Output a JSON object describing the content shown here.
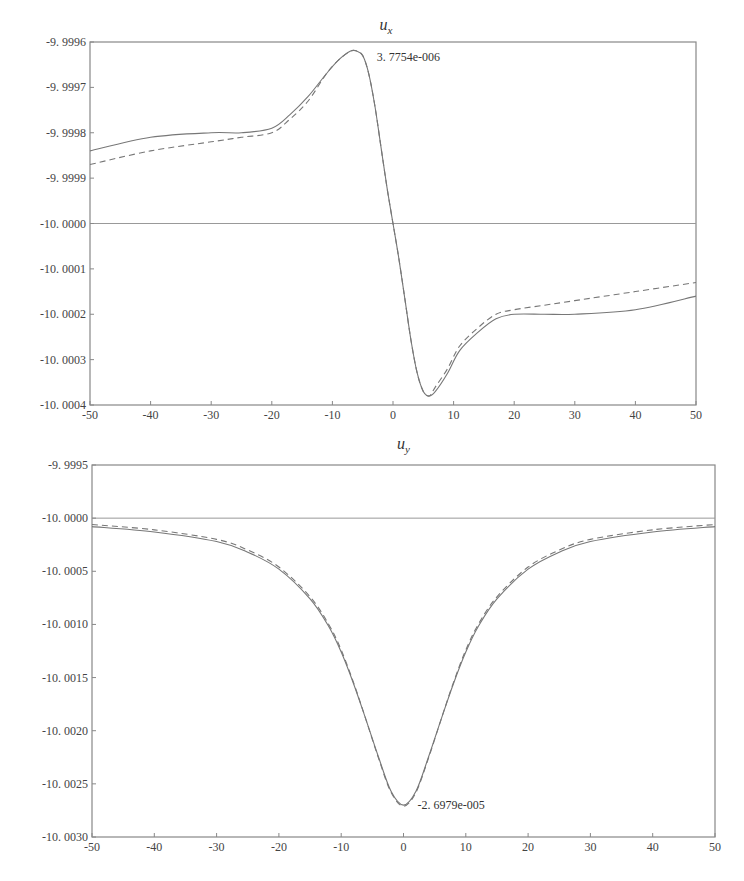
{
  "chart_data": [
    {
      "type": "line",
      "title": "u_x",
      "title_main": "u",
      "title_sub": "x",
      "xlabel": "",
      "ylabel": "",
      "xlim": [
        -50,
        50
      ],
      "ylim": [
        -10.0004,
        -9.9996
      ],
      "xticks": [
        -50,
        -40,
        -30,
        -20,
        -10,
        0,
        10,
        20,
        30,
        40,
        50
      ],
      "xtick_labels": [
        "-50",
        "-40",
        "-30",
        "-20",
        "-10",
        "0",
        "10",
        "20",
        "30",
        "40",
        "50"
      ],
      "yticks": [
        -9.9996,
        -9.9997,
        -9.9998,
        -9.9999,
        -10.0,
        -10.0001,
        -10.0002,
        -10.0003,
        -10.0004
      ],
      "ytick_labels": [
        "-9. 9996",
        "-9. 9997",
        "-9. 9998",
        "-9. 9999",
        "-10. 0000",
        "-10. 0001",
        "-10. 0002",
        "-10. 0003",
        "-10. 0004"
      ],
      "reference_line": -10.0,
      "grid": false,
      "annotation": {
        "text": "3. 7754e-006",
        "x": -6,
        "y": -9.99962
      },
      "x": [
        -50,
        -40,
        -30,
        -25,
        -20,
        -17,
        -14,
        -11,
        -9,
        -7,
        -6,
        -5,
        -4,
        -3,
        -2,
        -1,
        0,
        1,
        2,
        3,
        4,
        5,
        6,
        7,
        9,
        11,
        14,
        17,
        20,
        25,
        30,
        40,
        50
      ],
      "series": [
        {
          "name": "solid",
          "style": "solid",
          "values": [
            -9.99984,
            -9.99981,
            -9.9998,
            -9.9998,
            -9.99979,
            -9.99976,
            -9.99972,
            -9.99967,
            -9.99964,
            -9.99962,
            -9.99962,
            -9.99963,
            -9.99967,
            -9.99974,
            -9.99983,
            -9.99992,
            -10.0,
            -10.00008,
            -10.00017,
            -10.00026,
            -10.00033,
            -10.00037,
            -10.00038,
            -10.00037,
            -10.00033,
            -10.00028,
            -10.00024,
            -10.00021,
            -10.0002,
            -10.0002,
            -10.0002,
            -10.00019,
            -10.00016
          ]
        },
        {
          "name": "dashed",
          "style": "dashed",
          "values": [
            -9.99987,
            -9.99984,
            -9.99982,
            -9.99981,
            -9.9998,
            -9.99977,
            -9.99973,
            -9.99967,
            -9.99964,
            -9.99962,
            -9.99962,
            -9.99963,
            -9.99967,
            -9.99974,
            -9.99983,
            -9.99992,
            -10.0,
            -10.00008,
            -10.00017,
            -10.00026,
            -10.00033,
            -10.00037,
            -10.00038,
            -10.00036,
            -10.00032,
            -10.00027,
            -10.00023,
            -10.0002,
            -10.00019,
            -10.00018,
            -10.00017,
            -10.00015,
            -10.00013
          ]
        }
      ]
    },
    {
      "type": "line",
      "title": "u_y",
      "title_main": "u",
      "title_sub": "y",
      "xlabel": "",
      "ylabel": "",
      "xlim": [
        -50,
        50
      ],
      "ylim": [
        -10.003,
        -9.9995
      ],
      "xticks": [
        -50,
        -40,
        -30,
        -20,
        -10,
        0,
        10,
        20,
        30,
        40,
        50
      ],
      "xtick_labels": [
        "-50",
        "-40",
        "-30",
        "-20",
        "-10",
        "0",
        "10",
        "20",
        "30",
        "40",
        "50"
      ],
      "yticks": [
        -9.9995,
        -10.0,
        -10.0005,
        -10.001,
        -10.0015,
        -10.002,
        -10.0025,
        -10.003
      ],
      "ytick_labels": [
        "-9. 9995",
        "-10. 0000",
        "-10. 0005",
        "-10. 0010",
        "-10. 0015",
        "-10. 0020",
        "-10. 0025",
        "-10. 0030"
      ],
      "reference_line": -10.0,
      "grid": false,
      "annotation": {
        "text": "-2. 6979e-005",
        "x": 0,
        "y": -10.0027
      },
      "x": [
        -50,
        -40,
        -30,
        -25,
        -20,
        -15,
        -12,
        -10,
        -8,
        -6,
        -4,
        -2,
        0,
        2,
        4,
        6,
        8,
        10,
        12,
        15,
        20,
        25,
        30,
        40,
        50
      ],
      "series": [
        {
          "name": "solid",
          "style": "solid",
          "values": [
            -10.00008,
            -10.00013,
            -10.00022,
            -10.00032,
            -10.00048,
            -10.00076,
            -10.00102,
            -10.00126,
            -10.00156,
            -10.0019,
            -10.00225,
            -10.00257,
            -10.0027,
            -10.00257,
            -10.00225,
            -10.0019,
            -10.00156,
            -10.00126,
            -10.00102,
            -10.00076,
            -10.00048,
            -10.00032,
            -10.00022,
            -10.00013,
            -10.00008
          ]
        },
        {
          "name": "dashed",
          "style": "dashed",
          "values": [
            -10.00006,
            -10.00011,
            -10.0002,
            -10.0003,
            -10.00046,
            -10.00074,
            -10.001,
            -10.00124,
            -10.00155,
            -10.0019,
            -10.00226,
            -10.00258,
            -10.00271,
            -10.00258,
            -10.00226,
            -10.0019,
            -10.00155,
            -10.00124,
            -10.001,
            -10.00074,
            -10.00046,
            -10.0003,
            -10.0002,
            -10.00011,
            -10.00006
          ]
        }
      ]
    }
  ],
  "colors": {
    "axis": "#888888",
    "line": "#777777",
    "text": "#333333"
  }
}
